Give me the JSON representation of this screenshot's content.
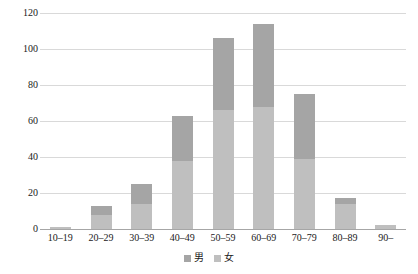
{
  "chart_data": {
    "type": "bar",
    "subtype": "stacked-column",
    "title": "",
    "xlabel": "",
    "ylabel": "",
    "categories": [
      "10–19",
      "20–29",
      "30–39",
      "40–49",
      "50–59",
      "60–69",
      "70–79",
      "80–89",
      "90–"
    ],
    "series": [
      {
        "name": "女",
        "color": "#bfbfbf",
        "values": [
          1,
          8,
          14,
          38,
          66,
          68,
          39,
          14,
          2
        ]
      },
      {
        "name": "男",
        "color": "#a5a5a5",
        "values": [
          0,
          5,
          11,
          25,
          40,
          46,
          36,
          3,
          0
        ]
      }
    ],
    "totals": [
      1,
      13,
      25,
      63,
      106,
      114,
      75,
      17,
      2
    ],
    "stack_order": [
      "女",
      "男"
    ],
    "ylim": [
      0,
      120
    ],
    "yticks": [
      0,
      20,
      40,
      60,
      80,
      100,
      120
    ],
    "ytick_labels": [
      "0",
      "20",
      "40",
      "60",
      "80",
      "100",
      "120"
    ],
    "grid": true,
    "grid_axis": "y",
    "legend_position": "bottom",
    "legend_entries": [
      {
        "label": "男",
        "color": "#a5a5a5"
      },
      {
        "label": "女",
        "color": "#bfbfbf"
      }
    ]
  }
}
